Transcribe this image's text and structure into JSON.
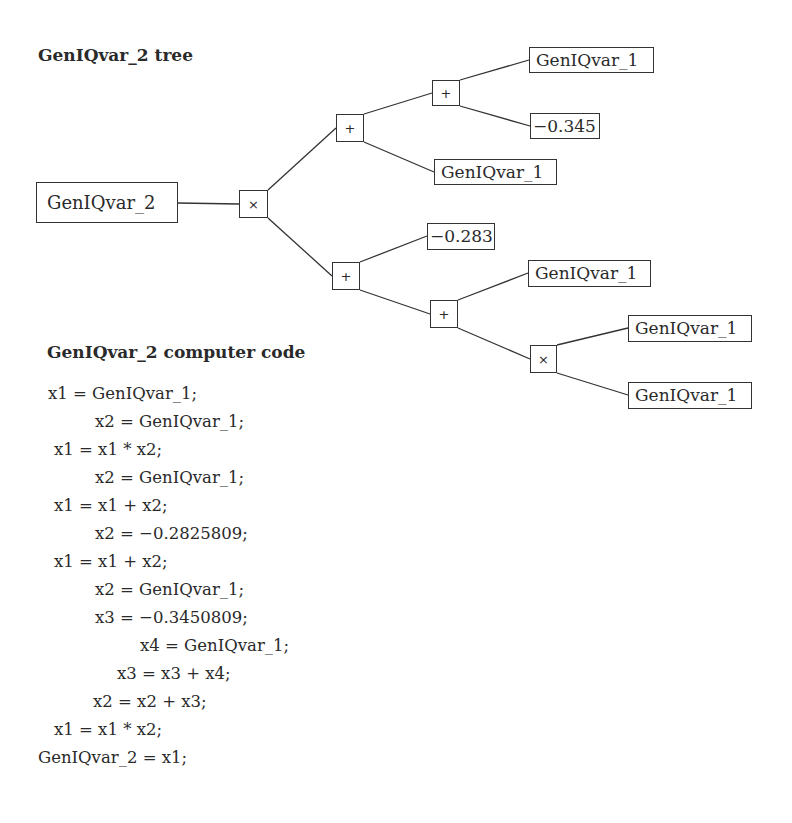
{
  "tree": {
    "title": "GenIQvar_2 tree",
    "root": {
      "label": "GenIQvar_2"
    },
    "ops": {
      "mult_root": "×",
      "plus_upper": "+",
      "plus_upper_inner": "+",
      "plus_lower": "+",
      "plus_lower_inner": "+",
      "mult_lower": "×"
    },
    "leaves": {
      "upper_inner_a": "GenIQvar_1",
      "upper_inner_b": "−0.345",
      "upper_b": "GenIQvar_1",
      "lower_a": "−0.283",
      "lower_inner_a": "GenIQvar_1",
      "lower_mult_a": "GenIQvar_1",
      "lower_mult_b": "GenIQvar_1"
    }
  },
  "code": {
    "title": "GenIQvar_2 computer code",
    "lines": [
      "x1 = GenIQvar_1;",
      "x2 = GenIQvar_1;",
      "x1 = x1 * x2;",
      "x2 = GenIQvar_1;",
      "x1 = x1 + x2;",
      "x2 = −0.2825809;",
      "x1 = x1 + x2;",
      "x2 = GenIQvar_1;",
      "x3 = −0.3450809;",
      "x4 = GenIQvar_1;",
      "x3 = x3 + x4;",
      "x2 = x2 + x3;",
      "x1 = x1 * x2;",
      "GenIQvar_2 = x1;"
    ]
  }
}
